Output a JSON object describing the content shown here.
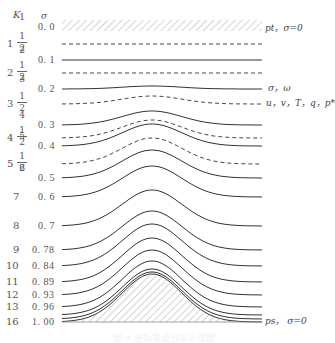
{
  "figure": {
    "column_headers": {
      "k": "K",
      "sigma": "σ"
    },
    "levels": [
      {
        "k": "1",
        "sigma": "0.0",
        "type": "top-boundary",
        "y": 27
      },
      {
        "k": "1½",
        "sigma": "",
        "type": "dashed",
        "y": 44,
        "amp": 0
      },
      {
        "k": "2",
        "sigma": "0.1",
        "type": "solid",
        "y": 60,
        "amp": 0
      },
      {
        "k": "2½",
        "sigma": "",
        "type": "dashed",
        "y": 73,
        "amp": 0
      },
      {
        "k": "3",
        "sigma": "0.2",
        "type": "solid",
        "y": 89,
        "amp": 3
      },
      {
        "k": "3½",
        "sigma": "",
        "type": "dashed",
        "y": 104,
        "amp": 8
      },
      {
        "k": "4",
        "sigma": "0.3",
        "type": "solid",
        "y": 125,
        "amp": 14
      },
      {
        "k": "4½",
        "sigma": "",
        "type": "dashed",
        "y": 138,
        "amp": 18
      },
      {
        "k": "5",
        "sigma": "0.4",
        "type": "solid",
        "y": 146,
        "amp": 22
      },
      {
        "k": "5½",
        "sigma": "",
        "type": "dashed",
        "y": 164,
        "amp": 26
      },
      {
        "k": "6",
        "sigma": "0.5",
        "type": "solid",
        "y": 178,
        "amp": 28
      },
      {
        "k": "7",
        "sigma": "0.6",
        "type": "solid",
        "y": 197,
        "amp": 31
      },
      {
        "k": "8",
        "sigma": "0.7",
        "type": "solid",
        "y": 226,
        "amp": 36
      },
      {
        "k": "9",
        "sigma": "0.78",
        "type": "solid",
        "y": 250,
        "amp": 39
      },
      {
        "k": "10",
        "sigma": "0.84",
        "type": "solid",
        "y": 266,
        "amp": 42
      },
      {
        "k": "11",
        "sigma": "0.89",
        "type": "solid",
        "y": 282,
        "amp": 44
      },
      {
        "k": "12",
        "sigma": "0.93",
        "type": "solid",
        "y": 295,
        "amp": 45
      },
      {
        "k": "13",
        "sigma": "0.96",
        "type": "solid",
        "y": 307,
        "amp": 46
      },
      {
        "k": "14",
        "sigma": "",
        "type": "solid",
        "y": 315,
        "amp": 46
      },
      {
        "k": "15",
        "sigma": "",
        "type": "solid",
        "y": 319,
        "amp": 47
      },
      {
        "k": "16",
        "sigma": "1.00",
        "type": "bottom-boundary",
        "y": 322,
        "amp": 48
      }
    ],
    "right_labels": {
      "top": "pt，σ=0",
      "solid_lines": "σ，ω",
      "dashed_lines": "u，v，T，q，p*",
      "bottom": "ps，  σ=0"
    },
    "caption": "图 σ 坐标垂直分层示意图"
  }
}
